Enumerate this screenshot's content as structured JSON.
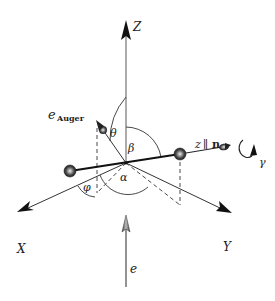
{
  "figure": {
    "type": "3D coordinate geometry diagram",
    "axes": {
      "z_label": "Z",
      "x_label": "X",
      "y_label": "Y"
    },
    "molecule": {
      "axis_label_z": "z",
      "axis_label_parallel": "∥",
      "axis_label_n": "n",
      "rotation_label": "γ"
    },
    "auger": {
      "label_e": "e",
      "label_sub": "Auger"
    },
    "beam": {
      "label": "e"
    },
    "angles": {
      "theta": "θ",
      "beta": "β",
      "alpha": "α",
      "phi": "φ"
    },
    "colors": {
      "line": "#222222",
      "axis_gray": "#777777",
      "atom_fill": "#555555",
      "arrow_fill": "#111111"
    }
  }
}
